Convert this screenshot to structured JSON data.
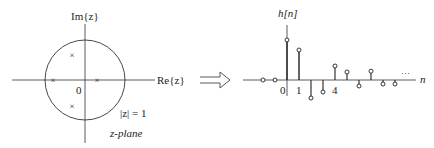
{
  "zplane": {
    "imag_axis_label": "Im{z}",
    "real_axis_label": "Re{z}",
    "origin_label": "0",
    "unit_circle_label": "|z| = 1",
    "plane_label": "z-plane",
    "poles": [
      {
        "re": -0.8,
        "im": 0
      },
      {
        "re": 0.3,
        "im": 0
      },
      {
        "re": -0.32,
        "im": 0.62
      },
      {
        "re": -0.32,
        "im": -0.62
      }
    ],
    "pole_marker": "×"
  },
  "arrow": {
    "icon": "double-arrow-right-icon"
  },
  "stem_plot": {
    "ylabel": "h[n]",
    "xlabel": "n",
    "tick_labels": [
      "0",
      "1",
      "4"
    ],
    "ellipsis": "···"
  },
  "chart_data": {
    "type": "stem",
    "title": "",
    "xlabel": "n",
    "ylabel": "h[n]",
    "x": [
      -2,
      -1,
      0,
      1,
      2,
      3,
      4,
      5,
      6,
      7,
      8,
      9
    ],
    "values": [
      0,
      0,
      1.0,
      0.75,
      -0.45,
      -0.3,
      0.35,
      0.2,
      -0.15,
      0.22,
      -0.1,
      -0.1
    ],
    "tick_labels": {
      "0": "0",
      "1": "1",
      "4": "4"
    },
    "continues": true
  }
}
